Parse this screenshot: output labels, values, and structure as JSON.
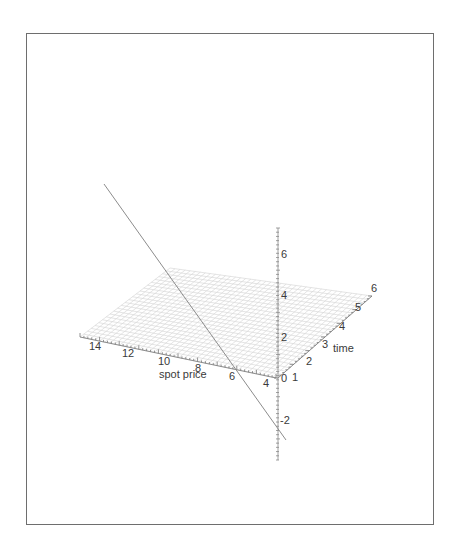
{
  "chart_data": {
    "type": "surface3d",
    "title": "",
    "axes": {
      "x": {
        "label": "spot price",
        "ticks": [
          14,
          12,
          10,
          8,
          6,
          4
        ],
        "range": [
          4,
          14
        ]
      },
      "y": {
        "label": "time",
        "ticks": [
          1,
          2,
          3,
          4,
          5,
          6
        ],
        "range": [
          0,
          6
        ]
      },
      "z": {
        "label": "",
        "ticks": [
          -2,
          0,
          2,
          4,
          6
        ],
        "range": [
          -3,
          7
        ]
      }
    },
    "series": [
      {
        "name": "surface",
        "kind": "mesh",
        "description": "near-flat grid plane around z≈0 spanning spot price 4–14 and time 0–6",
        "color": "#d4d4d4"
      },
      {
        "name": "line",
        "kind": "line",
        "description": "straight line crossing the plane, descending from upper-left (high spot price, high z) to lower-right (low spot price, z≈-3)",
        "color": "#8a8a8a"
      }
    ],
    "grid": false,
    "legend": null
  },
  "labels": {
    "x_axis": "spot price",
    "y_axis": "time",
    "x_ticks": [
      "14",
      "12",
      "10",
      "8",
      "6",
      "4"
    ],
    "y_ticks": [
      "1",
      "2",
      "3",
      "4",
      "5",
      "6"
    ],
    "z_ticks": [
      "6",
      "4",
      "2",
      "0",
      "-2"
    ]
  }
}
